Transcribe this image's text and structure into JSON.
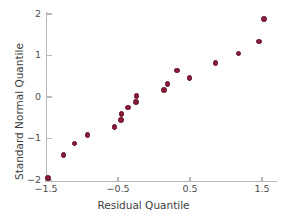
{
  "chart_data": {
    "type": "scatter",
    "title": "",
    "xlabel": "Residual Quantile",
    "ylabel": "Standard Normal Quantile",
    "xlim": [
      -1.62,
      1.71
    ],
    "ylim": [
      -2.12,
      2.05
    ],
    "xticks": [
      -1.5,
      -0.5,
      0.5,
      1.5
    ],
    "xticklabels": [
      "−1.5",
      "−0.5",
      "0.5",
      "1.5"
    ],
    "yticks": [
      -2,
      -1,
      0,
      1,
      2
    ],
    "yticklabels": [
      "−2",
      "−1",
      "0",
      "1",
      "2"
    ],
    "grid": false,
    "legend": false,
    "marker_color": "#8e1838",
    "marker_edge_color": "#5c0f25",
    "axis_color": "#b9b9b9",
    "points": [
      {
        "x": -1.47,
        "y": -1.95
      },
      {
        "x": -1.26,
        "y": -1.4
      },
      {
        "x": -1.1,
        "y": -1.12
      },
      {
        "x": -0.92,
        "y": -0.92
      },
      {
        "x": -0.55,
        "y": -0.72
      },
      {
        "x": -0.46,
        "y": -0.55
      },
      {
        "x": -0.45,
        "y": -0.41
      },
      {
        "x": -0.36,
        "y": -0.25
      },
      {
        "x": -0.25,
        "y": -0.12
      },
      {
        "x": -0.24,
        "y": 0.02
      },
      {
        "x": 0.14,
        "y": 0.17
      },
      {
        "x": 0.19,
        "y": 0.31
      },
      {
        "x": 0.32,
        "y": 0.64
      },
      {
        "x": 0.49,
        "y": 0.46
      },
      {
        "x": 0.85,
        "y": 0.82
      },
      {
        "x": 1.17,
        "y": 1.05
      },
      {
        "x": 1.46,
        "y": 1.34
      },
      {
        "x": 1.53,
        "y": 1.88
      }
    ]
  }
}
